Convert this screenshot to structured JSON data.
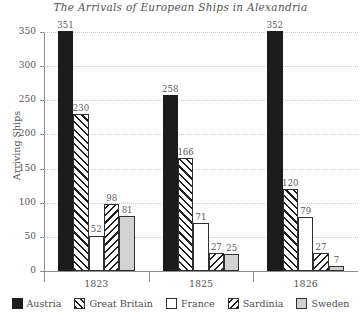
{
  "chart_data": {
    "type": "bar",
    "title": "The Arrivals of European Ships in Alexandria",
    "xlabel": "",
    "ylabel": "Arriving Ships",
    "categories": [
      "1823",
      "1825",
      "1826"
    ],
    "ylim": [
      0,
      350
    ],
    "yticks": [
      0,
      50,
      100,
      150,
      200,
      250,
      300,
      350
    ],
    "ytick_labels": [
      "0",
      "50",
      "100",
      "150",
      "200",
      "250",
      "300",
      "350"
    ],
    "grid": true,
    "legend_position": "bottom",
    "data_labels": true,
    "series": [
      {
        "name": "Austria",
        "fill": "solid-black",
        "color": "#1c1c1c",
        "values": [
          351,
          258,
          352
        ],
        "labels": [
          "351",
          "258",
          "352"
        ]
      },
      {
        "name": "Great Britain",
        "fill": "hatch-forward",
        "color": "#ffffff",
        "values": [
          230,
          166,
          120
        ],
        "labels": [
          "230",
          "166",
          "120"
        ]
      },
      {
        "name": "France",
        "fill": "solid-white",
        "color": "#ffffff",
        "values": [
          52,
          71,
          79
        ],
        "labels": [
          "52",
          "71",
          "79"
        ]
      },
      {
        "name": "Sardinia",
        "fill": "hatch-backward",
        "color": "#ffffff",
        "values": [
          98,
          27,
          27
        ],
        "labels": [
          "98",
          "27",
          "27"
        ]
      },
      {
        "name": "Sweden",
        "fill": "solid-gray",
        "color": "#d2d2d2",
        "values": [
          81,
          25,
          7
        ],
        "labels": [
          "81",
          "25",
          "7"
        ]
      }
    ]
  },
  "legend": {
    "items": [
      {
        "label": "Austria"
      },
      {
        "label": "Great Britain"
      },
      {
        "label": "France"
      },
      {
        "label": "Sardinia"
      },
      {
        "label": "Sweden"
      }
    ]
  }
}
